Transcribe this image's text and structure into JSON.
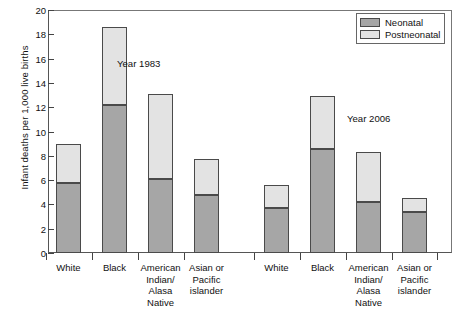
{
  "chart_data": {
    "type": "bar",
    "subtype": "stacked-bar",
    "title": "",
    "xlabel": "",
    "ylabel": "Infant deaths per 1,000 live births",
    "ylim": [
      0,
      20
    ],
    "yticks": [
      0,
      2,
      4,
      6,
      8,
      10,
      12,
      14,
      16,
      18,
      20
    ],
    "grid": false,
    "legend_position": "top-right",
    "legend": [
      "Neonatal",
      "Postneonatal"
    ],
    "group_annotations": [
      "Year 1983",
      "Year 2006"
    ],
    "categories": [
      "White",
      "Black",
      "American Indian/ Alasa Native",
      "Asian or Pacific islander"
    ],
    "groups": [
      {
        "name": "Year 1983",
        "bars": [
          {
            "category": "White",
            "neonatal": 5.8,
            "postneonatal": 3.2,
            "total": 9.0
          },
          {
            "category": "Black",
            "neonatal": 12.2,
            "postneonatal": 6.4,
            "total": 18.6
          },
          {
            "category": "American Indian/ Alasa Native",
            "neonatal": 6.1,
            "postneonatal": 7.0,
            "total": 13.1
          },
          {
            "category": "Asian or Pacific islander",
            "neonatal": 4.8,
            "postneonatal": 2.9,
            "total": 7.7
          }
        ]
      },
      {
        "name": "Year 2006",
        "bars": [
          {
            "category": "White",
            "neonatal": 3.7,
            "postneonatal": 1.9,
            "total": 5.6
          },
          {
            "category": "Black",
            "neonatal": 8.6,
            "postneonatal": 4.3,
            "total": 12.9
          },
          {
            "category": "American Indian/ Alasa Native",
            "neonatal": 4.2,
            "postneonatal": 4.1,
            "total": 8.3
          },
          {
            "category": "Asian or Pacific islander",
            "neonatal": 3.4,
            "postneonatal": 1.1,
            "total": 4.5
          }
        ]
      }
    ],
    "colors": {
      "neonatal": "#a6a6a6",
      "postneonatal": "#e3e3e3",
      "outline": "#4a4a4a",
      "axis": "#555555",
      "text": "#111111"
    }
  },
  "axis": {
    "y_title": "Infant deaths per 1,000 live births",
    "tick_labels": [
      "0",
      "2",
      "4",
      "6",
      "8",
      "10",
      "12",
      "14",
      "16",
      "18",
      "20"
    ]
  },
  "legend": {
    "items": [
      {
        "label": "Neonatal",
        "swatch": "neonatal"
      },
      {
        "label": "Postneonatal",
        "swatch": "postneonatal"
      }
    ]
  },
  "annotations": {
    "left_group": "Year 1983",
    "right_group": "Year 2006"
  },
  "category_lines": {
    "white": [
      "White"
    ],
    "black": [
      "Black"
    ],
    "american_indian": [
      "American",
      "Indian/",
      "Alasa",
      "Native"
    ],
    "asian": [
      "Asian or",
      "Pacific",
      "islander"
    ]
  }
}
